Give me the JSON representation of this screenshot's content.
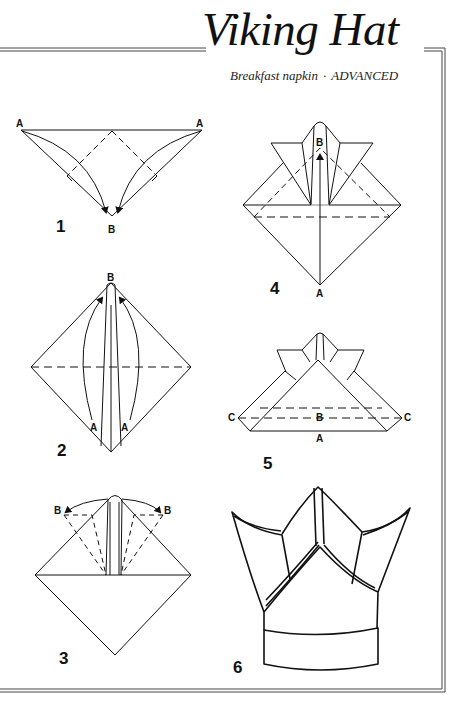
{
  "header": {
    "title": "Viking Hat",
    "subtitle_item": "Breakfast napkin",
    "subtitle_separator": "·",
    "subtitle_level": "ADVANCED"
  },
  "steps": [
    {
      "number": "1",
      "labels": [
        "A",
        "A",
        "B"
      ]
    },
    {
      "number": "2",
      "labels": [
        "B",
        "A",
        "A"
      ]
    },
    {
      "number": "3",
      "labels": [
        "B",
        "B"
      ]
    },
    {
      "number": "4",
      "labels": [
        "B",
        "A"
      ]
    },
    {
      "number": "5",
      "labels": [
        "C",
        "B",
        "C",
        "A"
      ]
    },
    {
      "number": "6",
      "labels": []
    }
  ],
  "colors": {
    "ink": "#111111",
    "frame": "#444444",
    "background": "#ffffff"
  }
}
